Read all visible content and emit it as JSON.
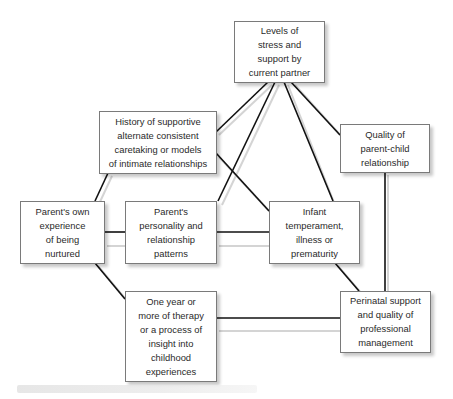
{
  "diagram": {
    "nodes": [
      {
        "id": "partner",
        "label": "Levels of\nstress and\nsupport by\ncurrent partner"
      },
      {
        "id": "history",
        "label": "History of supportive\nalternate consistent\ncaretaking or models\nof intimate relationships"
      },
      {
        "id": "quality",
        "label": "Quality of\nparent-child\nrelationship"
      },
      {
        "id": "own",
        "label": "Parent's own\nexperience\nof being\nnurtured"
      },
      {
        "id": "personality",
        "label": "Parent's\npersonality and\nrelationship\npatterns"
      },
      {
        "id": "infant",
        "label": "Infant\ntemperament,\nillness or\nprematurity"
      },
      {
        "id": "therapy",
        "label": "One year or\nmore of therapy\nor a process of\ninsight into\nchildhood\nexperiences"
      },
      {
        "id": "perinatal",
        "label": "Perinatal support\nand quality of\nprofessional\nmanagement"
      }
    ],
    "edges": [
      [
        "partner",
        "history"
      ],
      [
        "partner",
        "personality"
      ],
      [
        "partner",
        "infant"
      ],
      [
        "partner",
        "quality"
      ],
      [
        "history",
        "own"
      ],
      [
        "history",
        "infant"
      ],
      [
        "own",
        "personality"
      ],
      [
        "personality",
        "infant"
      ],
      [
        "own",
        "therapy"
      ],
      [
        "infant",
        "perinatal"
      ],
      [
        "quality",
        "perinatal"
      ],
      [
        "therapy",
        "perinatal"
      ]
    ],
    "line_color": "#111111"
  }
}
